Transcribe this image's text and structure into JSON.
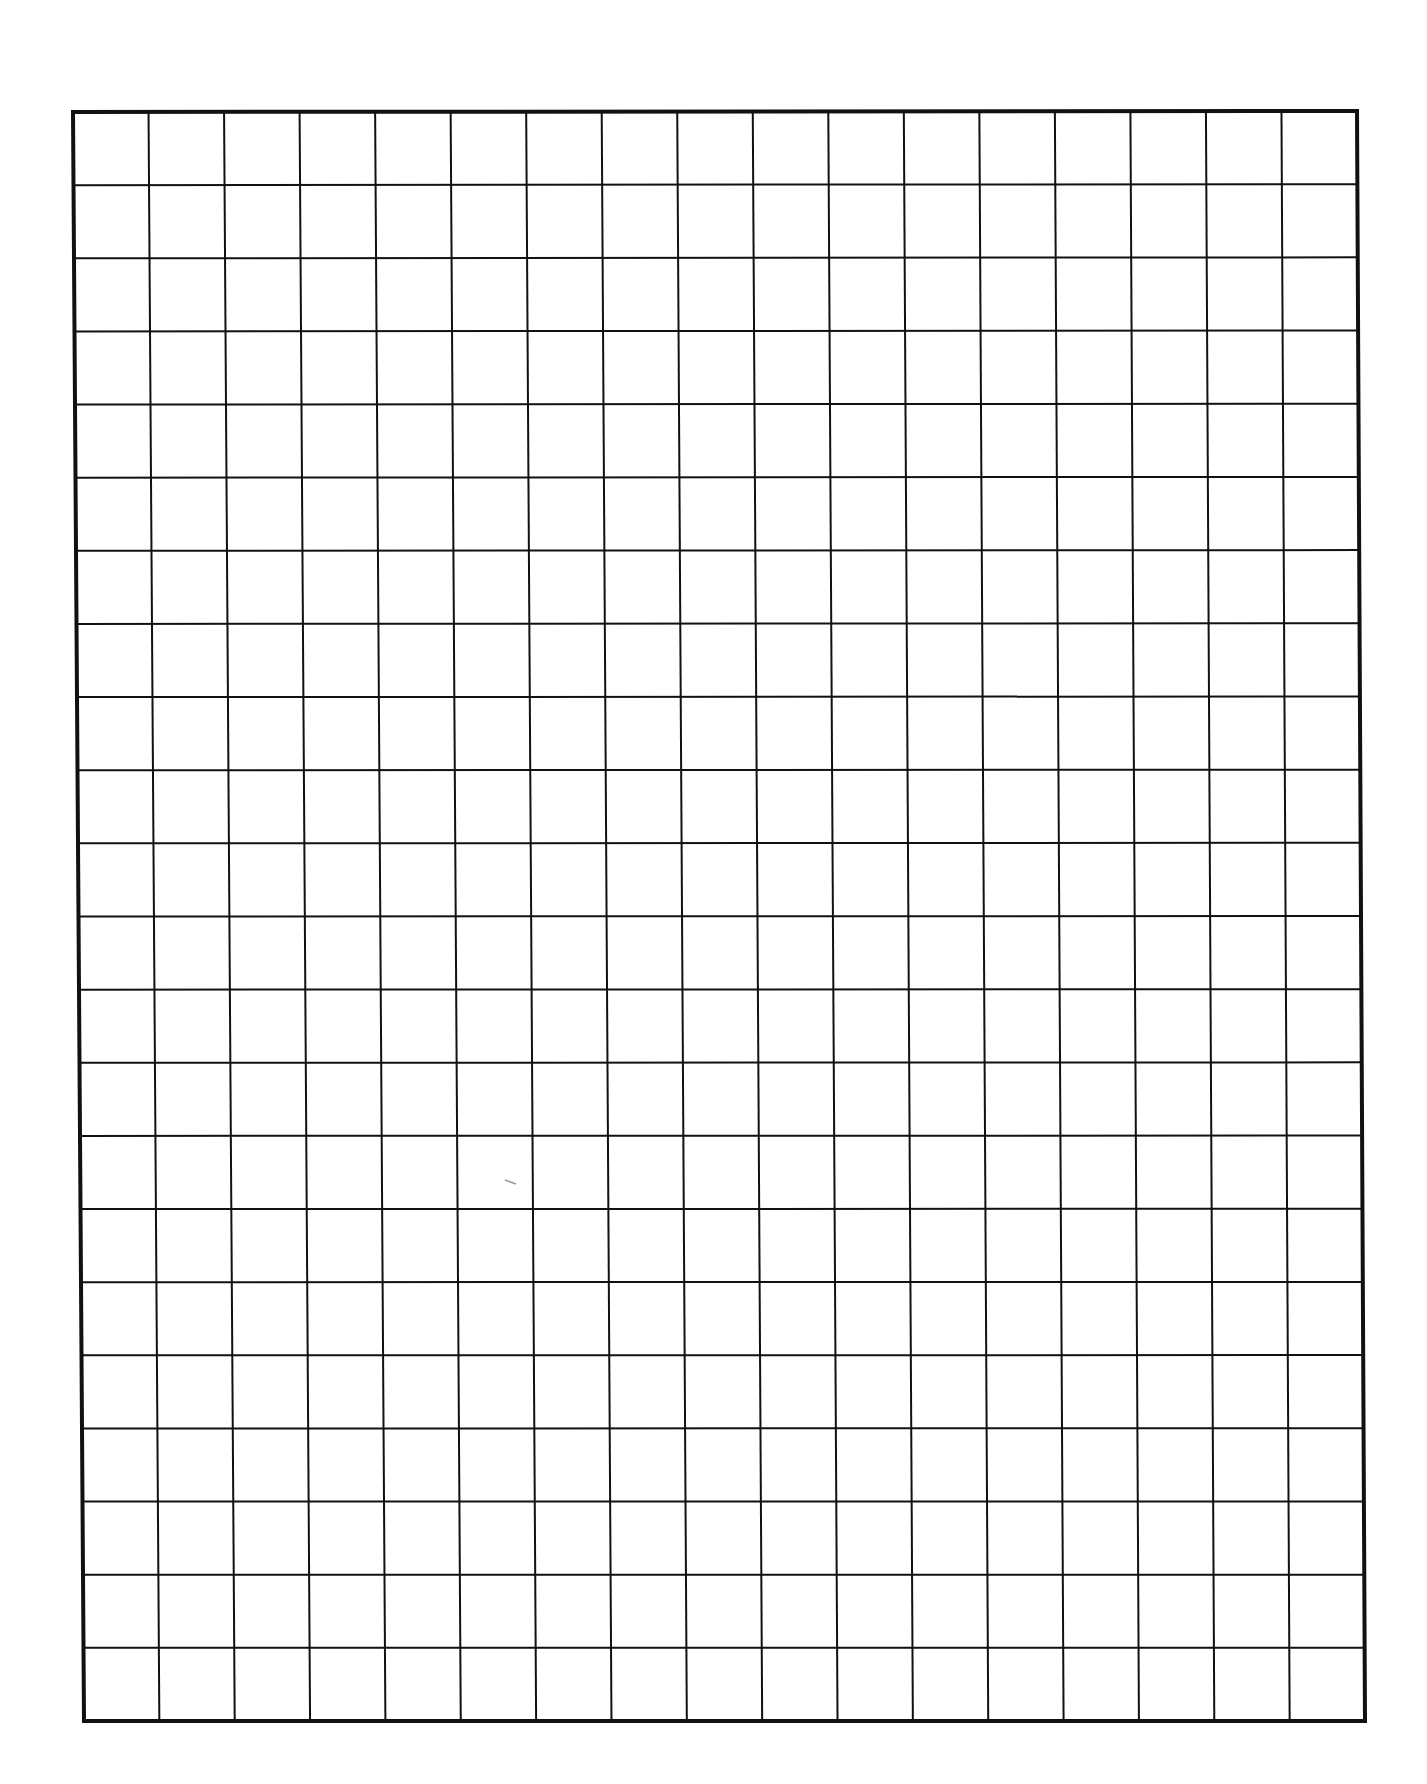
{
  "page": {
    "type": "blank graph paper",
    "background_color": "#ffffff",
    "line_color": "#111111"
  },
  "grid": {
    "columns": 17,
    "rows": 22,
    "corners": {
      "top_left": [
        73,
        112
      ],
      "top_right": [
        1357,
        111
      ],
      "bottom_left": [
        84,
        1721
      ],
      "bottom_right": [
        1365,
        1721
      ]
    },
    "border_width": 4,
    "line_width": 2
  },
  "marks": [
    {
      "name": "stray-pencil-mark",
      "x1": 505,
      "y1": 1180,
      "x2": 516,
      "y2": 1184,
      "color": "#9a9a9a"
    }
  ]
}
